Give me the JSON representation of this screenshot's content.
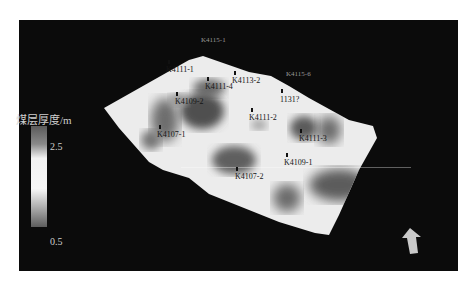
{
  "figure": {
    "background": "#0b0b0b",
    "legend": {
      "title": "煤层厚度/m",
      "max": "2.5",
      "min": "0.5",
      "colormap": "grayscale (dark = thin, light = thick at middle)"
    },
    "boreholes": [
      {
        "label": "K4111-1"
      },
      {
        "label": "K4111-4"
      },
      {
        "label": "K4113-2"
      },
      {
        "label": "K4109-2"
      },
      {
        "label": "1131?"
      },
      {
        "label": "K4111-2"
      },
      {
        "label": "K4107-1"
      },
      {
        "label": "K4111-3"
      },
      {
        "label": "K4109-1"
      },
      {
        "label": "K4107-2"
      }
    ],
    "edge_labels": [
      {
        "label": "K4115-1"
      },
      {
        "label": "K4115-6"
      }
    ],
    "north_arrow": "north-arrow"
  }
}
